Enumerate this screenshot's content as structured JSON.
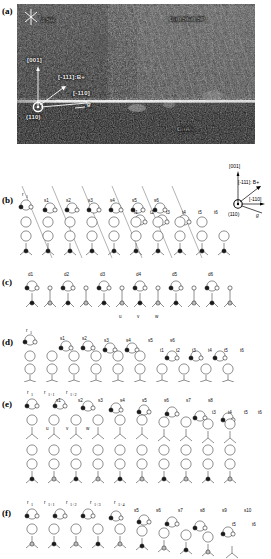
{
  "figure": {
    "panels": [
      {
        "id": "a",
        "label": "(a)"
      },
      {
        "id": "b",
        "label": "(b)"
      },
      {
        "id": "c",
        "label": "(c)"
      },
      {
        "id": "d",
        "label": "(d)"
      },
      {
        "id": "e",
        "label": "(e)"
      },
      {
        "id": "f",
        "label": "(f)"
      }
    ]
  },
  "micrograph": {
    "panel_label": "(a)",
    "scale_label": "3.5Å",
    "top_right_material": "Ga0.5In0.5P",
    "bottom_right_material": "GaAs",
    "zone_axis": "(110)",
    "direction_vertical": "[001]",
    "direction_diagonal": "[-111]:B+",
    "direction_horizontal": "[-110]",
    "diffraction_vector": "g"
  },
  "axis_legend": {
    "vertical": "[001]",
    "diagonal": "[-111]: B+",
    "horizontal": "[-110]",
    "zone": "(110)",
    "g_vector": "g"
  },
  "panel_b": {
    "label": "(b)",
    "r_labels": [
      "r1"
    ],
    "s_labels": [
      "s1",
      "s2",
      "s3",
      "s4",
      "s5",
      "s6"
    ],
    "t_labels": [
      "t1",
      "t2",
      "t3",
      "t4",
      "t5",
      "t6"
    ]
  },
  "panel_c": {
    "label": "(c)",
    "d_labels": [
      "d1",
      "d2",
      "d3",
      "d4",
      "d5",
      "d6"
    ],
    "site_labels": [
      "u",
      "v",
      "w"
    ]
  },
  "panel_d": {
    "label": "(d)",
    "r_labels": [
      "r1"
    ],
    "s_labels": [
      "s1",
      "s2",
      "s3",
      "s4",
      "s5",
      "s6"
    ],
    "t_labels": [
      "t1",
      "t2",
      "t3",
      "t4",
      "t5",
      "t6"
    ]
  },
  "panel_e": {
    "label": "(e)",
    "r_labels": [
      "r1",
      "r1+1",
      "r1+2"
    ],
    "s_labels": [
      "s1",
      "s2",
      "s3",
      "s4",
      "s5",
      "s6",
      "s7",
      "s8"
    ],
    "t_labels": [
      "t3",
      "t4",
      "t5",
      "t6"
    ],
    "site_labels": [
      "u",
      "v",
      "w"
    ]
  },
  "panel_f": {
    "label": "(f)",
    "r_labels": [
      "r1",
      "r1+1",
      "r1+2",
      "r1+3",
      "r1+4"
    ],
    "s_labels": [
      "s5",
      "s6",
      "s7",
      "s8",
      "s9",
      "s10"
    ],
    "t_labels": [
      "t5",
      "t6"
    ]
  },
  "colors": {
    "background": "#ffffff",
    "ink": "#000000",
    "micrograph_dark": "#0a0a0a",
    "micrograph_bright": "#f0f0f0",
    "atom_filled": "#1a1a1a",
    "atom_open": "#ffffff",
    "atom_grey": "#b8b8b8"
  }
}
